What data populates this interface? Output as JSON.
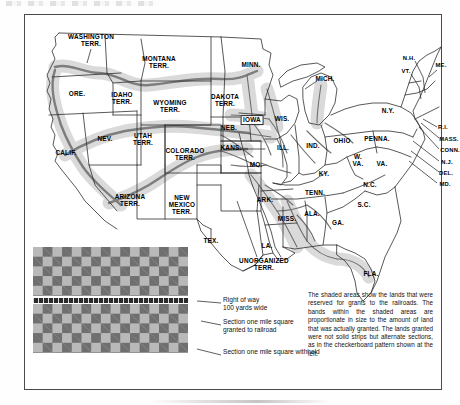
{
  "map": {
    "title_partial": "",
    "western_territories": [
      {
        "name": "WASHINGTON\nTERR.",
        "x": 66,
        "y": 26
      },
      {
        "name": "MONTANA\nTERR.",
        "x": 134,
        "y": 48
      },
      {
        "name": "ORE.",
        "x": 52,
        "y": 79
      },
      {
        "name": "IDAHO\nTERR.",
        "x": 97,
        "y": 84
      },
      {
        "name": "WYOMING\nTERR.",
        "x": 145,
        "y": 92
      },
      {
        "name": "DAKOTA\nTERR.",
        "x": 200,
        "y": 86
      },
      {
        "name": "NEB.",
        "x": 204,
        "y": 113
      },
      {
        "name": "NEV.",
        "x": 80,
        "y": 124
      },
      {
        "name": "UTAH\nTERR.",
        "x": 118,
        "y": 125
      },
      {
        "name": "CALIF.",
        "x": 41,
        "y": 138
      },
      {
        "name": "COLORADO\nTERR.",
        "x": 160,
        "y": 140
      },
      {
        "name": "KANS.",
        "x": 206,
        "y": 133
      },
      {
        "name": "ARIZONA\nTERR.",
        "x": 105,
        "y": 186
      },
      {
        "name": "NEW\nMEXICO\nTERR.",
        "x": 157,
        "y": 190
      },
      {
        "name": "TEX.",
        "x": 186,
        "y": 226
      },
      {
        "name": "UNORGANIZED\nTERR.",
        "x": 239,
        "y": 250
      }
    ],
    "midwest_states": [
      {
        "name": "MINN.",
        "x": 226,
        "y": 50
      },
      {
        "name": "IOWA",
        "x": 227,
        "y": 105,
        "boxed": true
      },
      {
        "name": "WIS.",
        "x": 257,
        "y": 104
      },
      {
        "name": "MICH.",
        "x": 300,
        "y": 64
      },
      {
        "name": "ILL.",
        "x": 258,
        "y": 133
      },
      {
        "name": "MO.",
        "x": 231,
        "y": 150
      },
      {
        "name": "IND.",
        "x": 288,
        "y": 131
      },
      {
        "name": "OHIO",
        "x": 317,
        "y": 126
      },
      {
        "name": "KY.",
        "x": 299,
        "y": 159
      },
      {
        "name": "ARK.",
        "x": 240,
        "y": 185
      },
      {
        "name": "TENN.",
        "x": 290,
        "y": 178
      },
      {
        "name": "MISS.",
        "x": 262,
        "y": 204
      },
      {
        "name": "ALA.",
        "x": 287,
        "y": 199
      },
      {
        "name": "LA.",
        "x": 242,
        "y": 231
      },
      {
        "name": "GA.",
        "x": 313,
        "y": 208
      },
      {
        "name": "FLA.",
        "x": 346,
        "y": 259
      },
      {
        "name": "S.C.",
        "x": 339,
        "y": 190
      },
      {
        "name": "N.C.",
        "x": 345,
        "y": 170
      },
      {
        "name": "VA.",
        "x": 357,
        "y": 149
      },
      {
        "name": "W.\nVA.",
        "x": 333,
        "y": 146
      },
      {
        "name": "PENNA.",
        "x": 352,
        "y": 124
      },
      {
        "name": "N.Y.",
        "x": 363,
        "y": 96
      }
    ],
    "leader_labels": [
      {
        "name": "N.H.",
        "x": 384,
        "y": 43
      },
      {
        "name": "VT.",
        "x": 381,
        "y": 56
      },
      {
        "name": "ME.",
        "x": 416,
        "y": 50
      },
      {
        "name": "R.I.",
        "x": 418,
        "y": 112
      },
      {
        "name": "MASS.",
        "x": 424,
        "y": 124
      },
      {
        "name": "CONN.",
        "x": 425,
        "y": 135
      },
      {
        "name": "N.J.",
        "x": 422,
        "y": 147
      },
      {
        "name": "DEL.",
        "x": 421,
        "y": 158
      },
      {
        "name": "MD.",
        "x": 420,
        "y": 169
      }
    ]
  },
  "legend": {
    "right_of_way": "Right of way\n100 yards wide",
    "granted": "Section one mile square\ngranted to railroad",
    "withheld": "Section one mile square withheld"
  },
  "note": {
    "text": "The shaded areas show the lands that were reserved for grants to the railroads. The bands within the shaded areas are proportionate in size to the amount of land that was actually granted. The lands granted were not solid strips but alternate sections, as in the checkerboard pattern shown at the left."
  },
  "colors": {
    "corridor_band": "#d7d7d7",
    "rail_line": "#8a8a8a",
    "checker_dark": "#6f6f6f",
    "checker_light": "#b9b9b9",
    "right_of_way_strip": "#2b2b2b",
    "border": "#4a4a4a",
    "state_line": "#333333"
  }
}
